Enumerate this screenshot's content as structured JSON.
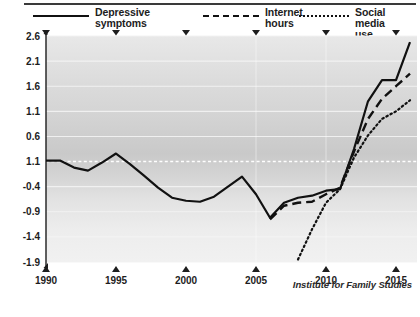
{
  "legend": {
    "items": [
      {
        "id": "depressive",
        "label": "Depressive\nsymptoms",
        "style": "solid"
      },
      {
        "id": "internet",
        "label": "Internet\nhours",
        "style": "dashed"
      },
      {
        "id": "social",
        "label": "Social media use",
        "style": "dotted"
      }
    ]
  },
  "credit": "Institute for Family Studies",
  "chart_data": {
    "type": "line",
    "title": "",
    "subtitle": "",
    "xlabel": "",
    "ylabel": "",
    "xlim": [
      1990,
      2016.5
    ],
    "ylim": [
      -1.9,
      2.6
    ],
    "grid": true,
    "legend_position": "top",
    "ytick_labels": [
      "2.6",
      "2.1",
      "1.6",
      "1.1",
      "0.6",
      "1.1",
      "-0.4",
      "-0.9",
      "-1.4",
      "-1.9"
    ],
    "ytick_values": [
      2.6,
      2.1,
      1.6,
      1.1,
      0.6,
      0.1,
      -0.4,
      -0.9,
      -1.4,
      -1.9
    ],
    "xtick_labels": [
      "1990",
      "1995",
      "2000",
      "2005",
      "2010",
      "2015"
    ],
    "xtick_values": [
      1990,
      1995,
      2000,
      2005,
      2010,
      2015
    ],
    "reference_line": {
      "value": 0.1,
      "style": "dashed",
      "color": "#ffffff"
    },
    "series": [
      {
        "name": "Depressive symptoms",
        "style": "solid",
        "color": "#111111",
        "x": [
          1990,
          1991,
          1992,
          1993,
          1994,
          1995,
          1996,
          1997,
          1998,
          1999,
          2000,
          2001,
          2002,
          2003,
          2004,
          2005,
          2006,
          2007,
          2008,
          2009,
          2010,
          2011,
          2012,
          2013,
          2014,
          2015,
          2016
        ],
        "y": [
          0.12,
          0.12,
          -0.02,
          -0.08,
          0.08,
          0.26,
          0.05,
          -0.18,
          -0.42,
          -0.62,
          -0.68,
          -0.7,
          -0.6,
          -0.4,
          -0.2,
          -0.55,
          -1.02,
          -0.72,
          -0.62,
          -0.58,
          -0.48,
          -0.45,
          0.35,
          1.3,
          1.72,
          1.72,
          2.48
        ]
      },
      {
        "name": "Internet hours",
        "style": "dashed",
        "color": "#111111",
        "x": [
          2006,
          2007,
          2008,
          2009,
          2010,
          2011,
          2012,
          2013,
          2014,
          2015,
          2016
        ],
        "y": [
          -1.05,
          -0.78,
          -0.72,
          -0.7,
          -0.55,
          -0.42,
          0.3,
          0.95,
          1.35,
          1.6,
          1.85
        ]
      },
      {
        "name": "Social media use",
        "style": "dotted",
        "color": "#111111",
        "x": [
          2008,
          2009,
          2010,
          2011,
          2012,
          2013,
          2014,
          2015,
          2016
        ],
        "y": [
          -1.85,
          -1.25,
          -0.72,
          -0.45,
          0.18,
          0.62,
          0.95,
          1.1,
          1.32
        ]
      }
    ]
  }
}
